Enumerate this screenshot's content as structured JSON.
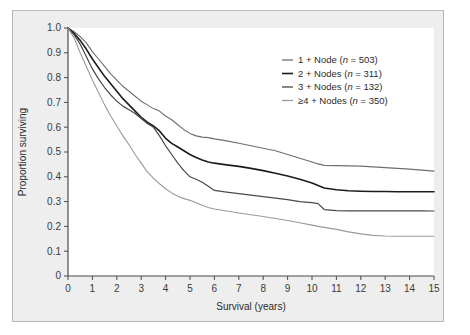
{
  "figure": {
    "background_color": "#eeeeee",
    "plot_background_color": "#ffffff",
    "frame_border_color": "#b9b9b9",
    "axis_color": "#4a4a4a"
  },
  "chart_data": {
    "type": "line",
    "title": "",
    "subtitle": "",
    "xlabel": "Survival (years)",
    "ylabel": "Proportion surviving",
    "xlim": [
      0,
      15
    ],
    "ylim": [
      0,
      1.0
    ],
    "xticks": [
      0,
      1,
      2,
      3,
      4,
      5,
      6,
      7,
      8,
      9,
      10,
      11,
      12,
      13,
      14,
      15
    ],
    "xtick_labels": [
      "0",
      "1",
      "2",
      "3",
      "4",
      "5",
      "6",
      "7",
      "8",
      "9",
      "10",
      "11",
      "12",
      "13",
      "14",
      "15"
    ],
    "yticks": [
      0,
      0.1,
      0.2,
      0.3,
      0.4,
      0.5,
      0.6,
      0.7,
      0.8,
      0.9,
      1.0
    ],
    "ytick_labels": [
      "0",
      "0.1",
      "0.2",
      "0.3",
      "0.4",
      "0.5",
      "0.6",
      "0.7",
      "0.8",
      "0.9",
      "1.0"
    ],
    "grid": false,
    "legend_position": "upper-right",
    "x": [
      0,
      0.25,
      0.5,
      0.75,
      1,
      1.25,
      1.5,
      1.75,
      2,
      2.25,
      2.5,
      2.75,
      3,
      3.25,
      3.5,
      3.75,
      4,
      4.25,
      4.5,
      4.75,
      5,
      5.25,
      5.5,
      5.75,
      6,
      6.5,
      7,
      7.5,
      8,
      8.5,
      9,
      9.5,
      10,
      10.25,
      10.5,
      11,
      11.5,
      12,
      12.5,
      13,
      13.5,
      14,
      14.5,
      15
    ],
    "series": [
      {
        "name": "1 + Node (n = 503)",
        "label_main": "1 + Node (",
        "label_italic": "n",
        "label_tail": " = 503)",
        "n": 503,
        "color": "#6e6e6e",
        "width": 1.1,
        "endpoint": 0.42,
        "values": [
          1.0,
          0.985,
          0.965,
          0.94,
          0.905,
          0.875,
          0.845,
          0.815,
          0.79,
          0.765,
          0.745,
          0.725,
          0.705,
          0.69,
          0.675,
          0.665,
          0.645,
          0.63,
          0.61,
          0.59,
          0.575,
          0.565,
          0.56,
          0.558,
          0.553,
          0.545,
          0.535,
          0.525,
          0.515,
          0.505,
          0.49,
          0.475,
          0.46,
          0.452,
          0.446,
          0.445,
          0.444,
          0.443,
          0.44,
          0.437,
          0.434,
          0.431,
          0.427,
          0.423
        ]
      },
      {
        "name": "2 + Nodes (n = 311)",
        "label_main": "2 + Nodes (",
        "label_italic": "n",
        "label_tail": " = 311)",
        "n": 311,
        "color": "#1c1c1c",
        "width": 1.6,
        "endpoint": 0.34,
        "values": [
          1.0,
          0.978,
          0.95,
          0.915,
          0.875,
          0.84,
          0.805,
          0.775,
          0.745,
          0.715,
          0.69,
          0.665,
          0.64,
          0.62,
          0.605,
          0.585,
          0.555,
          0.535,
          0.52,
          0.505,
          0.49,
          0.478,
          0.468,
          0.46,
          0.455,
          0.448,
          0.442,
          0.434,
          0.425,
          0.414,
          0.403,
          0.39,
          0.375,
          0.365,
          0.355,
          0.348,
          0.344,
          0.342,
          0.341,
          0.341,
          0.34,
          0.34,
          0.34,
          0.34
        ]
      },
      {
        "name": "3 + Nodes (n = 132)",
        "label_main": "3 + Nodes (",
        "label_italic": "n",
        "label_tail": " = 132)",
        "n": 132,
        "color": "#494949",
        "width": 1.2,
        "endpoint": 0.26,
        "values": [
          1.0,
          0.972,
          0.935,
          0.885,
          0.835,
          0.795,
          0.76,
          0.73,
          0.705,
          0.685,
          0.67,
          0.655,
          0.635,
          0.615,
          0.6,
          0.565,
          0.525,
          0.49,
          0.455,
          0.425,
          0.4,
          0.39,
          0.378,
          0.362,
          0.345,
          0.338,
          0.332,
          0.326,
          0.32,
          0.314,
          0.308,
          0.3,
          0.296,
          0.292,
          0.268,
          0.264,
          0.263,
          0.263,
          0.263,
          0.263,
          0.263,
          0.263,
          0.263,
          0.262
        ]
      },
      {
        "name": "≥4 + Nodes (n = 350)",
        "label_main": "≥4 + Nodes (",
        "label_italic": "n",
        "label_tail": " = 350)",
        "n": 350,
        "color": "#9a9a9a",
        "width": 1.1,
        "endpoint": 0.16,
        "values": [
          1.0,
          0.96,
          0.9,
          0.845,
          0.79,
          0.74,
          0.69,
          0.645,
          0.605,
          0.565,
          0.53,
          0.49,
          0.455,
          0.42,
          0.395,
          0.372,
          0.352,
          0.335,
          0.322,
          0.312,
          0.305,
          0.295,
          0.285,
          0.276,
          0.27,
          0.262,
          0.254,
          0.247,
          0.24,
          0.232,
          0.224,
          0.215,
          0.205,
          0.2,
          0.196,
          0.188,
          0.178,
          0.17,
          0.164,
          0.161,
          0.16,
          0.16,
          0.16,
          0.16
        ]
      }
    ]
  }
}
